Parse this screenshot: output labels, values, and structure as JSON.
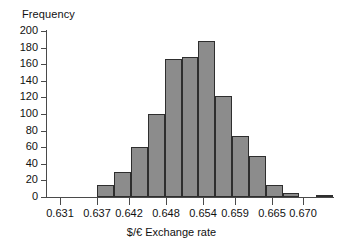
{
  "chart_data": {
    "type": "bar",
    "title": "",
    "subtitle": "",
    "xlabel": "$/€ Exchange rate",
    "ylabel": "Frequency",
    "ylim": [
      0,
      200
    ],
    "ytick_step": 20,
    "grid": false,
    "legend": null,
    "bin_width": 0.0027,
    "bin_edges": [
      0.637,
      0.6397,
      0.6424,
      0.6451,
      0.6478,
      0.6505,
      0.6532,
      0.6559,
      0.6586,
      0.6613,
      0.664,
      0.6667,
      0.6694,
      0.6721,
      0.6748
    ],
    "categories": [
      "0.6370-0.6397",
      "0.6397-0.6424",
      "0.6424-0.6451",
      "0.6451-0.6478",
      "0.6478-0.6505",
      "0.6505-0.6532",
      "0.6532-0.6559",
      "0.6559-0.6586",
      "0.6586-0.6613",
      "0.6613-0.6640",
      "0.6640-0.6667",
      "0.6667-0.6694",
      "0.6694-0.6721",
      "0.6721-0.6748"
    ],
    "values": [
      14,
      30,
      60,
      100,
      166,
      169,
      188,
      122,
      74,
      49,
      14,
      5,
      0,
      2
    ],
    "x_axis_start": 0.6289,
    "x_axis_end": 0.6748,
    "xticks": [
      0.631,
      0.637,
      0.642,
      0.648,
      0.654,
      0.659,
      0.665,
      0.67
    ],
    "xtick_labels": [
      "0.631",
      "0.637",
      "0.642",
      "0.648",
      "0.654",
      "0.659",
      "0.665",
      "0.670"
    ],
    "yticks": [
      0,
      20,
      40,
      60,
      80,
      100,
      120,
      140,
      160,
      180,
      200
    ],
    "ytick_labels": [
      "0",
      "20",
      "40",
      "60",
      "80",
      "100",
      "120",
      "140",
      "160",
      "180",
      "200"
    ],
    "bar_fill": "#8c8c8c",
    "bar_stroke": "#2e2e2e",
    "axis_color": "#4a4a4a",
    "background": "#ffffff"
  }
}
